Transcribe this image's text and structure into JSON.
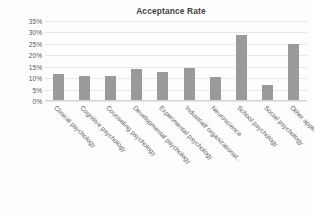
{
  "chart_data": {
    "type": "bar",
    "title": "Acceptance Rate",
    "xlabel": "",
    "ylabel": "",
    "ylim": [
      0,
      35
    ],
    "ytick_labels": [
      "35%",
      "30%",
      "25%",
      "20%",
      "15%",
      "10%",
      "5%",
      "0%"
    ],
    "ytick_values": [
      35,
      30,
      25,
      20,
      15,
      10,
      5,
      0
    ],
    "grid": true,
    "legend": "none",
    "bar_color": "#9a9a9a",
    "categories": [
      "Clinical psychology",
      "Cognitive psychology",
      "Counseling psychology",
      "Developmental psychology",
      "Experimental psychology",
      "Industrial/ organizational...",
      "Neuroscience",
      "School psychology",
      "Social psychology",
      "Other applied psychology"
    ],
    "values": [
      12,
      11,
      11,
      14,
      12.5,
      14.5,
      10.5,
      29,
      7,
      25
    ]
  }
}
